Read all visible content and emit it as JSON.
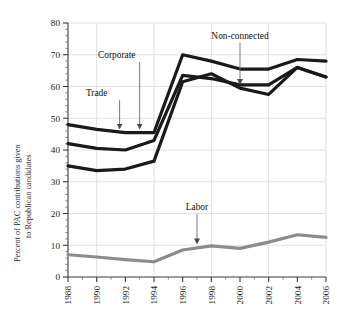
{
  "chart_data": {
    "type": "line",
    "title": "",
    "xlabel": "",
    "ylabel": "Percent of PAC contributions given to Republican candidates",
    "ylabel_line1": "Percent of PAC contributions given",
    "ylabel_line2": "to Republican candidates",
    "x": [
      1988,
      1990,
      1992,
      1994,
      1996,
      1998,
      2000,
      2002,
      2004,
      2006
    ],
    "xlim": [
      1988,
      2006
    ],
    "ylim": [
      0,
      80
    ],
    "xticks": [
      "1988",
      "1990",
      "1992",
      "1994",
      "1996",
      "1998",
      "2000",
      "2002",
      "2004",
      "2006"
    ],
    "yticks": [
      "0",
      "10",
      "20",
      "30",
      "40",
      "50",
      "60",
      "70",
      "80"
    ],
    "yticks_minor_step": 2,
    "grid": "horizontal-and-vertical",
    "legend": "none-inline-annotations",
    "series": [
      {
        "name": "Trade",
        "color": "#1a1a1a",
        "values": [
          48,
          46.5,
          45.5,
          45.5,
          70,
          68,
          65.5,
          65.5,
          68.5,
          68
        ]
      },
      {
        "name": "Corporate",
        "color": "#1a1a1a",
        "values": [
          42,
          40.5,
          40,
          43,
          63.5,
          62.5,
          60.5,
          60.5,
          66,
          63
        ]
      },
      {
        "name": "Non-connected",
        "color": "#1a1a1a",
        "values": [
          35,
          33.5,
          34,
          36.5,
          61.5,
          64,
          59.5,
          57.5,
          66,
          63
        ]
      },
      {
        "name": "Labor",
        "color": "#8c8c8c",
        "values": [
          7,
          6.3,
          5.5,
          4.8,
          8.5,
          9.8,
          9,
          11,
          13.3,
          12.5
        ]
      }
    ],
    "annotations": [
      {
        "label": "Trade",
        "x_label": 1990.0,
        "y_label": 57,
        "target_x": 1991.6,
        "target_y": 45.5
      },
      {
        "label": "Corporate",
        "x_label": 1991.4,
        "y_label": 69,
        "target_x": 1993.0,
        "target_y": 45.5
      },
      {
        "label": "Non-connected",
        "x_label": 2000.0,
        "y_label": 75,
        "target_x": 2000.0,
        "target_y": 59.5
      },
      {
        "label": "Labor",
        "x_label": 1997.0,
        "y_label": 21,
        "target_x": 1997.0,
        "target_y": 9.3
      }
    ]
  }
}
